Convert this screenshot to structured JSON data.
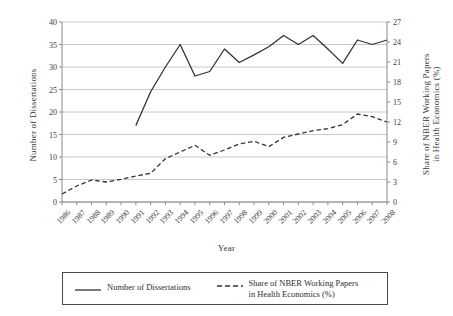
{
  "chart_data": {
    "type": "line",
    "title": "",
    "xlabel": "Year",
    "grid": true,
    "legend_position": "bottom",
    "categories": [
      "1986",
      "1987",
      "1988",
      "1989",
      "1990",
      "1991",
      "1992",
      "1993",
      "1994",
      "1995",
      "1996",
      "1997",
      "1998",
      "1999",
      "2000",
      "2001",
      "2002",
      "2003",
      "2004",
      "2005",
      "2006",
      "2007",
      "2008"
    ],
    "axes": {
      "left": {
        "label": "Number of Dissertations",
        "ylim": [
          0,
          40
        ],
        "ticks": [
          0,
          5,
          10,
          15,
          20,
          25,
          30,
          35,
          40
        ],
        "tick_labels": [
          "0",
          "5",
          "10",
          "15",
          "20",
          "25",
          "30",
          "35",
          "40"
        ]
      },
      "right": {
        "label": "Share of NBER Working Papers\nin Health Economics (%)",
        "ylim": [
          0,
          27
        ],
        "ticks": [
          0,
          3,
          6,
          9,
          12,
          15,
          18,
          21,
          24,
          27
        ],
        "tick_labels": [
          "0",
          "3",
          "6",
          "9",
          "12",
          "15",
          "18",
          "21",
          "24",
          "27"
        ]
      },
      "x": {
        "tick_labels": [
          "1986",
          "1987",
          "1988",
          "1989",
          "1990",
          "1991",
          "1992",
          "1993",
          "1994",
          "1995",
          "1996",
          "1997",
          "1998",
          "1999",
          "2000",
          "2001",
          "2002",
          "2003",
          "2004",
          "2005",
          "2006",
          "2007",
          "2008"
        ]
      }
    },
    "series": [
      {
        "name": "Number of Dissertations",
        "axis": "left",
        "style": "solid",
        "color": "#333333",
        "x": [
          "1991",
          "1992",
          "1993",
          "1994",
          "1995",
          "1996",
          "1997",
          "1998",
          "1999",
          "2000",
          "2001",
          "2002",
          "2003",
          "2004",
          "2005",
          "2006",
          "2007",
          "2008"
        ],
        "values": [
          17,
          24.5,
          30,
          35,
          28,
          29,
          34,
          31,
          32.7,
          34.5,
          37,
          35,
          37,
          34,
          30.8,
          36,
          35,
          36
        ]
      },
      {
        "name": "Share of NBER Working Papers\nin Health Economics (%)",
        "axis": "right",
        "style": "dashed",
        "color": "#333333",
        "x": [
          "1986",
          "1987",
          "1988",
          "1989",
          "1990",
          "1991",
          "1992",
          "1993",
          "1994",
          "1995",
          "1996",
          "1997",
          "1998",
          "1999",
          "2000",
          "2001",
          "2002",
          "2003",
          "2004",
          "2005",
          "2006",
          "2007",
          "2008"
        ],
        "values": [
          1.2,
          2.4,
          3.3,
          3.0,
          3.4,
          3.9,
          4.3,
          6.5,
          7.5,
          8.5,
          7.0,
          7.8,
          8.7,
          9.1,
          8.3,
          9.7,
          10.2,
          10.7,
          11.0,
          11.6,
          13.2,
          12.8,
          12.0
        ]
      }
    ]
  },
  "legend": {
    "items": [
      {
        "label": "Number of Dissertations",
        "style": "solid"
      },
      {
        "label": "Share of NBER Working Papers\nin Health Economics (%)",
        "style": "dashed"
      }
    ]
  },
  "colors": {
    "line": "#333333",
    "grid": "#c8c8c8",
    "axis": "#8a8a8a",
    "text": "#3a3a3a"
  }
}
